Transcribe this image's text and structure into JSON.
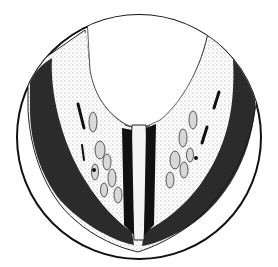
{
  "figure": {
    "kind": "pen-and-ink anatomical cross-section illustration",
    "field": "circular",
    "colors": {
      "background": "#ffffff",
      "ink": "#111111",
      "stipple": "#555555"
    },
    "text": []
  }
}
